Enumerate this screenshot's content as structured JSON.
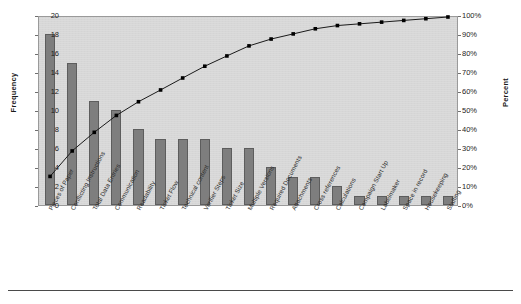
{
  "chart_data": {
    "type": "bar",
    "title": "",
    "subtitle": "",
    "xlabel": "",
    "ylabel": "Frequency",
    "y2label": "Percent",
    "ylim": [
      0,
      20
    ],
    "y2lim": [
      0,
      100
    ],
    "grid": false,
    "legend": "none",
    "categories": [
      "Pieces of Paper",
      "Conflicting Instructions",
      "Total Data Entries",
      "Communication",
      "Readability",
      "Ticket Flow",
      "Technical content",
      "Verifier Steps",
      "Ticket Size",
      "Multiple Versions",
      "Required Documents",
      "Attachments",
      "Cross references",
      "Calculations",
      "Campaign Start Up",
      "Labelmaker",
      "Space in record",
      "Housekeeping",
      "Staffing"
    ],
    "values": [
      18,
      15,
      11,
      10,
      8,
      7,
      7,
      7,
      6,
      6,
      4,
      3,
      3,
      2,
      1,
      1,
      1,
      1,
      1
    ],
    "total": 112,
    "cumulative_percent": [
      16.1,
      29.5,
      39.3,
      48.2,
      55.4,
      61.6,
      67.9,
      74.1,
      79.5,
      84.8,
      88.4,
      91.1,
      93.8,
      95.5,
      96.4,
      97.3,
      98.2,
      99.1,
      100.0
    ],
    "series": [
      {
        "name": "Frequency",
        "type": "bar",
        "axis": "left",
        "values": [
          18,
          15,
          11,
          10,
          8,
          7,
          7,
          7,
          6,
          6,
          4,
          3,
          3,
          2,
          1,
          1,
          1,
          1,
          1
        ]
      },
      {
        "name": "Cumulative Percent",
        "type": "line",
        "axis": "right",
        "values": [
          16.1,
          29.5,
          39.3,
          48.2,
          55.4,
          61.6,
          67.9,
          74.1,
          79.5,
          84.8,
          88.4,
          91.1,
          93.8,
          95.5,
          96.4,
          97.3,
          98.2,
          99.1,
          100.0
        ]
      }
    ],
    "yticks": [
      "0",
      "2",
      "4",
      "6",
      "8",
      "10",
      "12",
      "14",
      "16",
      "18",
      "20"
    ],
    "ytick_values": [
      0,
      2,
      4,
      6,
      8,
      10,
      12,
      14,
      16,
      18,
      20
    ],
    "y2ticks": [
      "0%",
      "10%",
      "20%",
      "30%",
      "40%",
      "50%",
      "60%",
      "70%",
      "80%",
      "90%",
      "100%"
    ],
    "y2tick_values": [
      0,
      10,
      20,
      30,
      40,
      50,
      60,
      70,
      80,
      90,
      100
    ],
    "colors": {
      "bar_fill": "#7e7e7e",
      "bar_stroke": "#5d5d5d",
      "line": "#1a1a1a",
      "marker": "#000000",
      "plot_background": "#d7d7d7",
      "plot_border": "#9a9a9a",
      "text": "#1d1d1d"
    }
  }
}
